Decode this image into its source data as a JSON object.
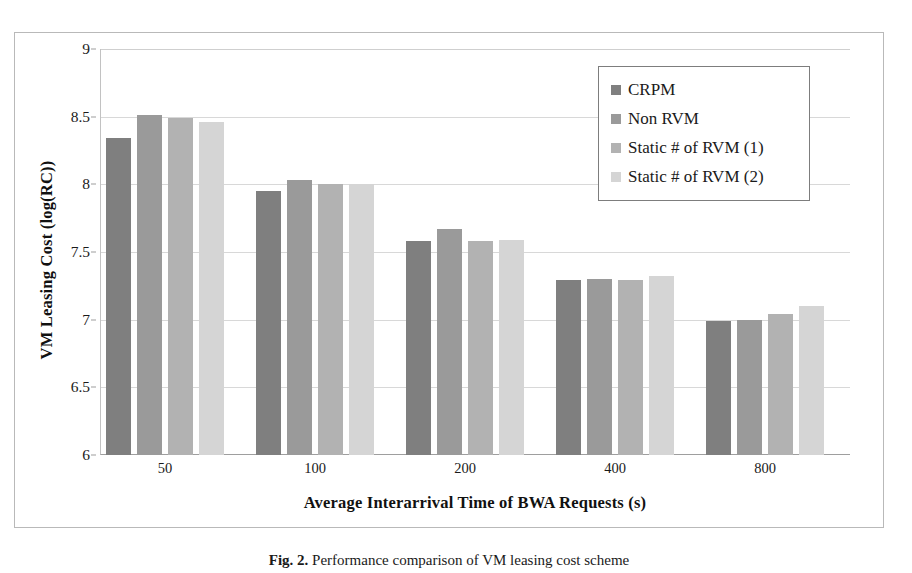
{
  "chart_data": {
    "type": "bar",
    "title": "",
    "xlabel": "Average Interarrival Time of BWA Requests (s)",
    "ylabel": "VM Leasing Cost (log(RC))",
    "categories": [
      "50",
      "100",
      "200",
      "400",
      "800"
    ],
    "ylim": [
      6,
      9
    ],
    "yticks": [
      "6",
      "6.5",
      "7",
      "7.5",
      "8",
      "8.5",
      "9"
    ],
    "ytick_values": [
      6,
      6.5,
      7,
      7.5,
      8,
      8.5,
      9
    ],
    "grid": true,
    "legend_position": "top-right",
    "series": [
      {
        "name": "CRPM",
        "color": "#7f7f7f",
        "values": [
          8.34,
          7.95,
          7.58,
          7.29,
          6.99
        ]
      },
      {
        "name": "Non RVM",
        "color": "#9a9a9a",
        "values": [
          8.51,
          8.03,
          7.67,
          7.3,
          7.0
        ]
      },
      {
        "name": "Static # of RVM (1)",
        "color": "#b2b2b2",
        "values": [
          8.49,
          8.0,
          7.58,
          7.29,
          7.04
        ]
      },
      {
        "name": "Static # of RVM (2)",
        "color": "#d5d5d5",
        "values": [
          8.46,
          8.0,
          7.59,
          7.32,
          7.1
        ]
      }
    ]
  },
  "caption": {
    "label": "Fig. 2.",
    "text": "Performance comparison of VM leasing cost scheme"
  }
}
